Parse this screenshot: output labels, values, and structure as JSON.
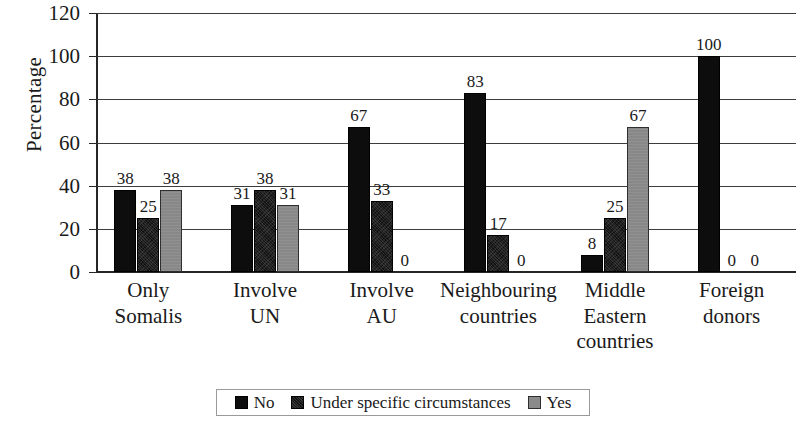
{
  "chart_data": {
    "type": "bar",
    "title": "",
    "xlabel": "",
    "ylabel": "Percentage",
    "ylim": [
      0,
      120
    ],
    "ytick_step": 20,
    "yticks": [
      0,
      20,
      40,
      60,
      80,
      100,
      120
    ],
    "grid": true,
    "legend_position": "bottom",
    "categories": [
      "Only\nSomalis",
      "Involve\nUN",
      "Involve\nAU",
      "Neighbouring\ncountries",
      "Middle\nEastern\ncountries",
      "Foreign\ndonors"
    ],
    "series": [
      {
        "name": "No",
        "color": "#0d0d0d",
        "values": [
          38,
          31,
          67,
          83,
          8,
          100
        ]
      },
      {
        "name": "Under specific circumstances",
        "color": "#141414",
        "values": [
          25,
          38,
          33,
          17,
          25,
          0
        ]
      },
      {
        "name": "Yes",
        "color": "#888888",
        "values": [
          38,
          31,
          0,
          0,
          67,
          0
        ]
      }
    ]
  },
  "axis": {
    "y_title": "Percentage",
    "y_tick_labels": [
      "120",
      "100",
      "80",
      "60",
      "40",
      "20",
      "0"
    ]
  },
  "legend": {
    "items": [
      {
        "label": "No",
        "swatch": "series-no"
      },
      {
        "label": "Under specific circumstances",
        "swatch": "series-usc"
      },
      {
        "label": "Yes",
        "swatch": "series-yes"
      }
    ]
  }
}
